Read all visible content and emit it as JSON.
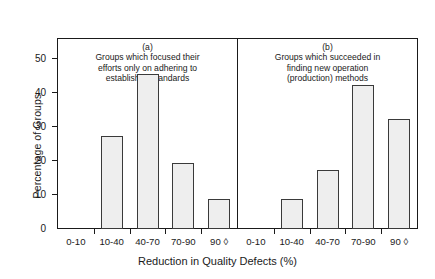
{
  "chart_data": {
    "type": "bar",
    "title": "",
    "xlabel": "Reduction in Quality Defects (%)",
    "ylabel": "Percentage of Groups",
    "categories": [
      "0-10",
      "10-40",
      "40-70",
      "70-90",
      "90 ◊"
    ],
    "ylim": [
      0,
      56
    ],
    "yticks": [
      0,
      10,
      20,
      30,
      40,
      50
    ],
    "ytick_labels": [
      "0",
      "10",
      "20",
      "30",
      "40",
      "50"
    ],
    "grid": false,
    "legend": null,
    "panels": [
      {
        "tag": "(a)",
        "title": "Groups which focused their\nefforts only on adhering to\nestablished standards",
        "values": [
          0,
          27.5,
          45.8,
          19.5,
          8.7
        ]
      },
      {
        "tag": "(b)",
        "title": "Groups which succeeded in\nfinding new operation\n(production) methods",
        "values": [
          0,
          8.7,
          17.5,
          42.5,
          32.5
        ]
      }
    ],
    "colors": {
      "bar_fill": "#eeeeee",
      "bar_edge": "#3a3a3a",
      "axis": "#1a1a1a",
      "background": "#ffffff"
    }
  }
}
